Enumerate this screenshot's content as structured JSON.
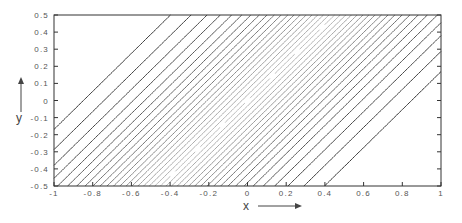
{
  "chart_data": {
    "type": "contour",
    "title": "",
    "xlabel": "x",
    "ylabel": "y",
    "xlim": [
      -1,
      1
    ],
    "ylim": [
      -0.5,
      0.5
    ],
    "x_ticks": [
      "-1",
      "-0.8",
      "-0.6",
      "-0.4",
      "-0.2",
      "0",
      "0.2",
      "0.4",
      "0.6",
      "0.8",
      "1"
    ],
    "y_ticks": [
      "0.5",
      "0.4",
      "0.3",
      "0.2",
      "0.1",
      "0",
      "-0.1",
      "-0.2",
      "-0.3",
      "-0.4",
      "-0.5"
    ],
    "grid": false,
    "legend": null,
    "contour_levels": 40,
    "line_color_edge": "#333333",
    "line_color_center": "#bbbbbb",
    "features": {
      "pattern": "diagonal bands running from lower-left to upper-right",
      "closed_contours": [
        "top-left corner",
        "bottom-right corner"
      ],
      "shading": "lines lighter near center, darker near left/right edges"
    },
    "axis_arrows": {
      "x": "right",
      "y": "up"
    }
  }
}
